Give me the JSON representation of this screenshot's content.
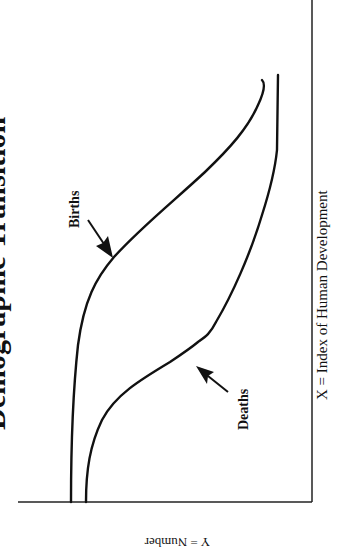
{
  "figure": {
    "title": "Demographic Transition",
    "x_axis_label": "X = Index of Human Development",
    "y_axis_label": "Y = Number",
    "annotations": [
      {
        "label": "Births",
        "points_to": "births-curve"
      },
      {
        "label": "Deaths",
        "points_to": "deaths-curve"
      }
    ],
    "colors": {
      "line": "#111111",
      "background": "#ffffff"
    }
  },
  "curves": {
    "births": {
      "label": "Births"
    },
    "deaths": {
      "label": "Deaths"
    }
  }
}
